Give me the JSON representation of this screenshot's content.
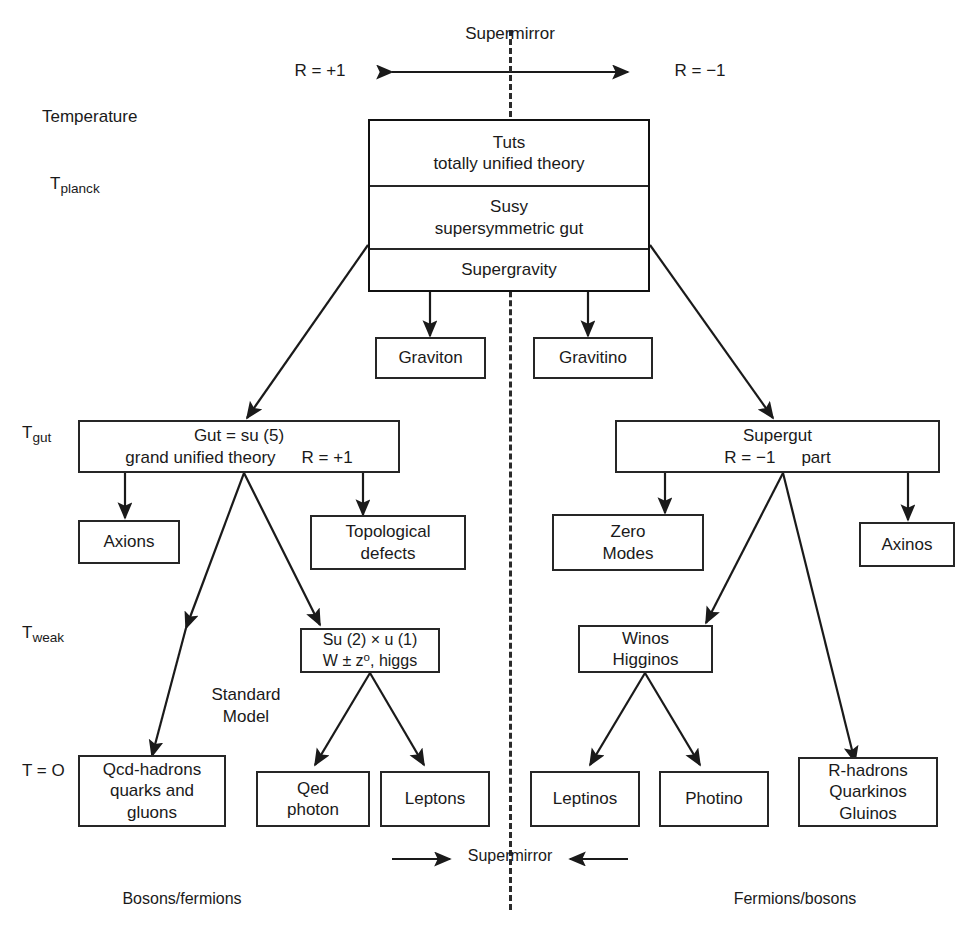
{
  "diagram": {
    "title": "Supermirror",
    "mirror_axis_label_top": "Supermirror",
    "mirror_axis_label_bottom": "Supermirror",
    "parity_left": "R = +1",
    "parity_right": "R = −1",
    "axis_label": "Temperature",
    "temperature_scale": [
      {
        "key": "planck",
        "base": "T",
        "sub": "planck"
      },
      {
        "key": "gut",
        "base": "T",
        "sub": "gut"
      },
      {
        "key": "weak",
        "base": "T",
        "sub": "weak"
      },
      {
        "key": "zero",
        "text": "T = O"
      }
    ],
    "side_labels": {
      "left": "Bosons/fermions",
      "right": "Fermions/bosons"
    },
    "annotations": {
      "standard_model_line1": "Standard",
      "standard_model_line2": "Model"
    },
    "top_stack": [
      {
        "line1": "Tuts",
        "line2": "totally unified theory"
      },
      {
        "line1": "Susy",
        "line2": "supersymmetric gut"
      },
      {
        "line1": "Supergravity",
        "line2": ""
      }
    ],
    "boxes": {
      "graviton": {
        "line1": "Graviton"
      },
      "gravitino": {
        "line1": "Gravitino"
      },
      "gut": {
        "line1": "Gut = su (5)",
        "line2": "grand unified theory",
        "line2_right": "R = +1"
      },
      "supergut": {
        "line1": "Supergut",
        "line2": "R = −1",
        "line2_right": "part"
      },
      "axions": {
        "line1": "Axions"
      },
      "topological_defects": {
        "line1": "Topological",
        "line2": "defects"
      },
      "zero_modes": {
        "line1": "Zero",
        "line2": "Modes"
      },
      "axinos": {
        "line1": "Axinos"
      },
      "electroweak": {
        "line1": "Su (2) × u (1)",
        "line2_a": "W ± z",
        "line2_sup": "o",
        "line2_b": ", higgs"
      },
      "winos_higginos": {
        "line1": "Winos",
        "line2": "Higginos"
      },
      "qcd": {
        "line1": "Qcd-hadrons",
        "line2": "quarks and",
        "line3": "gluons"
      },
      "qed": {
        "line1": "Qed",
        "line2": "photon"
      },
      "leptons": {
        "line1": "Leptons"
      },
      "leptinos": {
        "line1": "Leptinos"
      },
      "photino": {
        "line1": "Photino"
      },
      "r_hadrons": {
        "line1": "R-hadrons",
        "line2": "Quarkinos",
        "line3": "Gluinos"
      }
    },
    "colors": {
      "ink": "#1a1a1a",
      "stroke": "#262626",
      "background": "#ffffff"
    }
  }
}
